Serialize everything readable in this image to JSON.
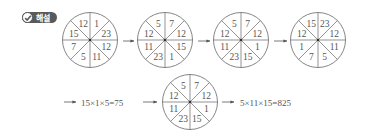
{
  "badge": {
    "icon": "check-circle-icon",
    "label": "해설"
  },
  "colors": {
    "line": "#666666",
    "text": "#555555",
    "badge_bg": "#5a5a5a"
  },
  "wheels": [
    {
      "id": "wheel-1",
      "cx": 90,
      "cy": 40,
      "sectors": [
        "1",
        "23",
        "12",
        "11",
        "5",
        "7",
        "15",
        "12"
      ]
    },
    {
      "id": "wheel-2",
      "cx": 165,
      "cy": 40,
      "sectors": [
        "7",
        "12",
        "15",
        "1",
        "23",
        "11",
        "12",
        "5"
      ]
    },
    {
      "id": "wheel-3",
      "cx": 241,
      "cy": 40,
      "sectors": [
        "7",
        "12",
        "1",
        "15",
        "23",
        "11",
        "12",
        "5"
      ]
    },
    {
      "id": "wheel-4",
      "cx": 318,
      "cy": 40,
      "sectors": [
        "23",
        "12",
        "11",
        "5",
        "7",
        "1",
        "12",
        "15"
      ]
    },
    {
      "id": "wheel-5",
      "cx": 190,
      "cy": 102,
      "sectors": [
        "7",
        "12",
        "1",
        "15",
        "23",
        "11",
        "12",
        "5"
      ]
    }
  ],
  "sector_order_note": "clockwise starting from top-right sector",
  "equations": {
    "first": "15×1×5=75",
    "second": "5×11×15=825"
  }
}
